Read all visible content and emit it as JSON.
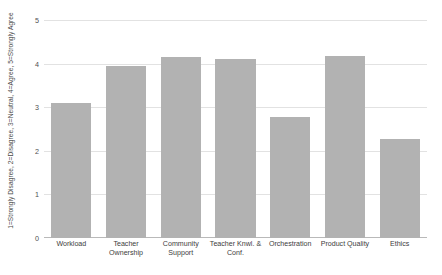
{
  "chart_data": {
    "type": "bar",
    "title": "",
    "xlabel": "",
    "ylabel": "1=Strongly Disagree, 2=Disagree, 3=Neutral, 4=Agree, 5=Strongly Agree",
    "categories": [
      "Workload",
      "Teacher Ownership",
      "Community Support",
      "Teacher Knwl. & Conf.",
      "Orchestration",
      "Product Quality",
      "Ethics"
    ],
    "values": [
      3.1,
      3.95,
      4.15,
      4.1,
      2.78,
      4.17,
      2.28
    ],
    "ylim": [
      0,
      5
    ],
    "yticks": [
      0,
      1,
      2,
      3,
      4,
      5
    ],
    "ytick_labels": [
      "0",
      "1",
      "2",
      "3",
      "4",
      "5"
    ],
    "grid": true,
    "legend": false,
    "legend_position": "none",
    "bar_color": "#b2b2b2",
    "gridline_color": "#e2e2e2",
    "axis_color": "#b9b9b9",
    "background_color": "#ffffff"
  }
}
